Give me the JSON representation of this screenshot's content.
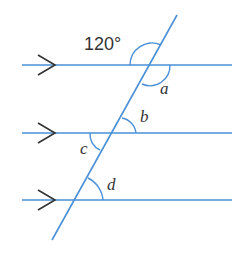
{
  "diagram": {
    "colors": {
      "line": "#4a90d9",
      "arrow": "#333333",
      "text": "#333333"
    },
    "lines": [
      {
        "id": "top",
        "y": 65
      },
      {
        "id": "middle",
        "y": 133
      },
      {
        "id": "bottom",
        "y": 200
      }
    ],
    "parallel_marker": "arrow",
    "labels": {
      "given_angle": "120°",
      "a": "a",
      "b": "b",
      "c": "c",
      "d": "d"
    }
  }
}
